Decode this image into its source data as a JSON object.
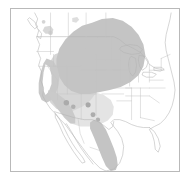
{
  "figure": {
    "kind": "species-range-map",
    "region": "Western North America",
    "frame": {
      "x": 10,
      "y": 8,
      "width": 170,
      "height": 164,
      "border_color": "#b9b9b9"
    },
    "background_color": "#ffffff",
    "projection_extent": {
      "west": -130,
      "east": -65,
      "south": 14,
      "north": 56
    }
  },
  "palette": {
    "ocean": "#ffffff",
    "land": "#ffffff",
    "boundary_line": "#bdbdbd",
    "coastline": "#b0b0b0",
    "range_dark": "#c2c2c2",
    "range_medium": "#d2d2d2",
    "range_light": "#e4e4e4",
    "point_locality": "#a9a9a9",
    "frame": "#b9b9b9"
  },
  "range_classes": [
    {
      "id": "core",
      "label": "Core range",
      "color": "#c2c2c2",
      "opacity": 1
    },
    {
      "id": "intermediate",
      "label": "Intermediate range",
      "color": "#d2d2d2",
      "opacity": 1
    },
    {
      "id": "peripheral",
      "label": "Peripheral range",
      "color": "#e4e4e4",
      "opacity": 1
    }
  ],
  "polygons": {
    "core_northern": "M 96 20 L 104 17 L 116 18 L 126 22 L 134 28 L 140 36 L 143 46 L 142 56 L 137 64 L 129 70 L 120 74 L 110 77 L 100 79 L 92 82 L 84 86 L 76 88 L 68 87 L 60 84 L 54 79 L 49 72 L 46 64 L 45 55 L 47 46 L 52 38 L 59 31 L 68 26 L 78 22 L 88 20 Z",
    "core_northern_top": "M 82 21 L 90 15 L 100 12 L 110 13 L 118 17 L 122 22 L 112 20 L 100 18 L 90 19 Z",
    "core_mexico": "M 86 116 L 92 118 L 97 124 L 101 132 L 105 141 L 108 150 L 110 157 L 109 163 L 105 166 L 100 165 L 95 160 L 91 152 L 87 143 L 83 134 L 80 126 L 80 120 L 83 116 Z",
    "core_california": "M 36 54 L 42 56 L 46 62 L 48 70 L 47 78 L 44 85 L 40 90 L 35 92 L 31 89 L 29 83 L 29 75 L 31 66 L 33 59 Z",
    "medium_basin": "M 44 46 L 54 42 L 64 41 L 74 43 L 82 48 L 88 56 L 91 66 L 90 76 L 86 85 L 80 93 L 72 99 L 63 103 L 54 104 L 46 101 L 40 95 L 36 87 L 34 77 L 35 66 L 38 56 Z",
    "light_southwest": "M 60 86 L 72 84 L 84 84 L 94 87 L 101 92 L 104 99 L 103 107 L 98 113 L 90 117 L 80 119 L 70 119 L 61 116 L 55 110 L 53 102 L 54 93 Z",
    "dark_spur_sw": "M 40 84 L 48 86 L 56 92 L 62 100 L 66 108 L 66 114 L 61 115 L 55 110 L 49 102 L 43 94 L 39 88 Z"
  },
  "point_localities": [
    {
      "id": "loc-1",
      "cx": 64,
      "cy": 93,
      "r": 2.6
    },
    {
      "id": "loc-2",
      "cx": 70,
      "cy": 97,
      "r": 2.2
    },
    {
      "id": "loc-3",
      "cx": 83,
      "cy": 96,
      "r": 2.4
    },
    {
      "id": "loc-4",
      "cx": 87,
      "cy": 105,
      "r": 2.4
    },
    {
      "id": "loc-5",
      "cx": 92,
      "cy": 110,
      "r": 2.2
    },
    {
      "id": "loc-6",
      "cx": 46,
      "cy": 27,
      "r": 2.2
    },
    {
      "id": "loc-7",
      "cx": 39,
      "cy": 18,
      "r": 1.8
    }
  ],
  "map_layers": [
    {
      "id": "state-boundaries",
      "label": "US state boundaries",
      "visible": true
    },
    {
      "id": "province-boundaries",
      "label": "Canadian province boundaries",
      "visible": true
    },
    {
      "id": "country-boundaries",
      "label": "Country boundaries",
      "visible": true
    },
    {
      "id": "coastline",
      "label": "Coastline",
      "visible": true
    }
  ],
  "annotations": {
    "title": "",
    "caption": "",
    "scale_bar": "",
    "north_arrow": ""
  }
}
